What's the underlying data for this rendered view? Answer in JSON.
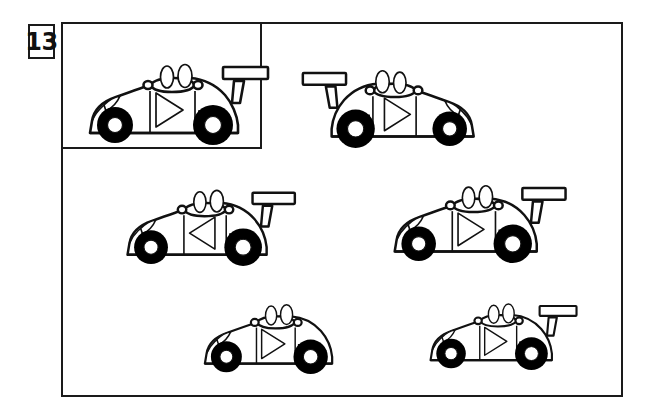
{
  "puzzle": {
    "number": "13",
    "type": "odd-one-out / matching shapes",
    "subject": "race-car",
    "icon_name": "race-car-icon",
    "reference_label": "13",
    "total_candidates": 5
  },
  "colors": {
    "ink": "#1a1a1a",
    "outline": "#111111",
    "paper": "#ffffff",
    "tire": "#000000",
    "hub": "#ffffff"
  },
  "frame": {
    "name": "puzzle-frame",
    "x": 61,
    "y": 22,
    "width": 562,
    "height": 375,
    "border_px": 2.5
  },
  "reference_box": {
    "name": "reference-inset-box",
    "x": 61,
    "y": 22,
    "width": 201,
    "height": 127,
    "border_px": 2.5
  },
  "cars": [
    {
      "id": "car-reference",
      "label": "Reference race car",
      "position": "inset top-left",
      "x": 82,
      "y": 45,
      "scale": 1.0,
      "facing": "right",
      "mirrored": false,
      "triangle_direction": "right",
      "has_spoiler": true,
      "spoiler_side": "rear-right",
      "matches_reference": true
    },
    {
      "id": "car-1",
      "label": "Candidate 1",
      "position": "top-right",
      "x": 299,
      "y": 52,
      "scale": 0.96,
      "facing": "left",
      "mirrored": true,
      "triangle_direction": "left",
      "has_spoiler": true,
      "spoiler_side": "rear-left",
      "matches_reference": false
    },
    {
      "id": "car-2",
      "label": "Candidate 2",
      "position": "middle-left",
      "x": 120,
      "y": 172,
      "scale": 0.94,
      "facing": "right",
      "mirrored": false,
      "triangle_direction": "left",
      "has_spoiler": true,
      "spoiler_side": "rear-right",
      "matches_reference": false
    },
    {
      "id": "car-3",
      "label": "Candidate 3",
      "position": "middle-right",
      "x": 387,
      "y": 167,
      "scale": 0.96,
      "facing": "right",
      "mirrored": false,
      "triangle_direction": "right",
      "has_spoiler": true,
      "spoiler_side": "rear-right",
      "matches_reference": true
    },
    {
      "id": "car-4",
      "label": "Candidate 4",
      "position": "bottom-left",
      "x": 198,
      "y": 288,
      "scale": 0.86,
      "facing": "right",
      "mirrored": false,
      "triangle_direction": "right",
      "has_spoiler": false,
      "spoiler_side": "none",
      "matches_reference": false
    },
    {
      "id": "car-5",
      "label": "Candidate 5",
      "position": "bottom-right",
      "x": 424,
      "y": 288,
      "scale": 0.82,
      "facing": "right",
      "mirrored": false,
      "triangle_direction": "right",
      "has_spoiler": true,
      "spoiler_side": "rear-right",
      "matches_reference": true
    }
  ]
}
